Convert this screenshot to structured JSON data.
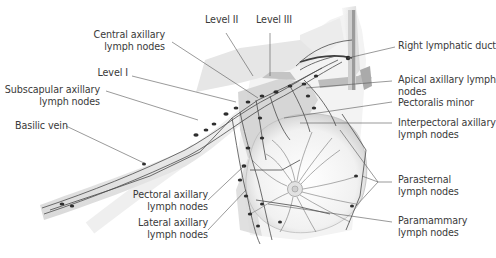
{
  "diagram": {
    "labels": {
      "level_ii": {
        "lines": [
          "Level II"
        ]
      },
      "level_iii": {
        "lines": [
          "Level III"
        ]
      },
      "central_axillary": {
        "lines": [
          "Central axillary",
          "lymph nodes"
        ]
      },
      "level_i": {
        "lines": [
          "Level I"
        ]
      },
      "subscapular_axillary": {
        "lines": [
          "Subscapular axillary",
          "lymph nodes"
        ]
      },
      "basilic_vein": {
        "lines": [
          "Basilic vein"
        ]
      },
      "right_lymphatic_duct": {
        "lines": [
          "Right lymphatic duct"
        ]
      },
      "apical_axillary": {
        "lines": [
          "Apical axillary lymph",
          "nodes"
        ]
      },
      "pectoralis_minor": {
        "lines": [
          "Pectoralis minor"
        ]
      },
      "interpectoral_axillary": {
        "lines": [
          "Interpectoral axillary",
          "lymph nodes"
        ]
      },
      "parasternal": {
        "lines": [
          "Parasternal",
          "lymph nodes"
        ]
      },
      "paramammary": {
        "lines": [
          "Paramammary",
          "lymph nodes"
        ]
      },
      "pectoral_axillary": {
        "lines": [
          "Pectoral axillary",
          "lymph nodes"
        ]
      },
      "lateral_axillary": {
        "lines": [
          "Lateral axillary",
          "lymph nodes"
        ]
      }
    },
    "colors": {
      "text": "#3a3a3a",
      "leader": "#555555",
      "vessel": "#4a4a4a",
      "node": "#2e2e2e",
      "muscle": "#cfcfcf",
      "skin_shadow": "#e4e4e4"
    }
  }
}
